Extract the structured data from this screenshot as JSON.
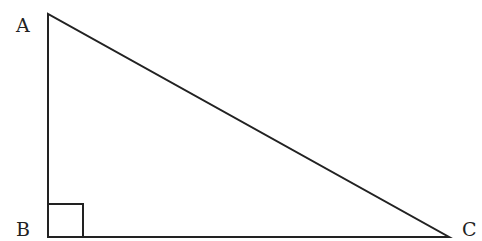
{
  "diagram": {
    "type": "right-triangle",
    "top_text_fragment": "Question text cut off at top",
    "vertices": [
      {
        "label": "A",
        "x": 48,
        "y": 14
      },
      {
        "label": "B",
        "x": 48,
        "y": 237
      },
      {
        "label": "C",
        "x": 449,
        "y": 237
      }
    ],
    "right_angle_at": "B",
    "right_angle_marker_size": 35,
    "stroke_color": "#222222"
  }
}
